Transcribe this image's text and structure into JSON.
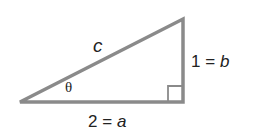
{
  "diagram": {
    "type": "right-triangle",
    "hypotenuse_label": "c",
    "angle_label": "θ",
    "vertical_side": {
      "value": "1",
      "eq": "=",
      "var": "b"
    },
    "horizontal_side": {
      "value": "2",
      "eq": "=",
      "var": "a"
    },
    "stroke_color": "#8a8a8a"
  }
}
